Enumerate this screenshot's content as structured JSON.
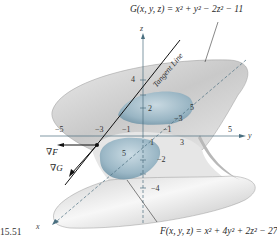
{
  "figure": {
    "number": "15.51",
    "surfaces": {
      "G": {
        "equation": "G(x, y, z) = x² + y² − 2z² − 11",
        "type": "hyperboloid of one sheet",
        "color": "#d8d8d8"
      },
      "F": {
        "equation": "F(x, y, z) = x² + 4y² + 2z² − 27",
        "type": "ellipsoid",
        "color": "#9fbccb"
      }
    },
    "axes": {
      "x": {
        "label": "x",
        "ticks": [
          "5"
        ]
      },
      "y": {
        "label": "y",
        "ticks": [
          "−5",
          "−3",
          "−1",
          "1",
          "3",
          "5"
        ]
      },
      "z": {
        "label": "z",
        "ticks": [
          "4",
          "2",
          "−2",
          "−4"
        ]
      }
    },
    "extra_ticks": [
      "−3",
      "5",
      "−1",
      "1"
    ],
    "annotations": {
      "tangent_line": "Tangent Line",
      "grad_F": "∇F",
      "grad_G": "∇G"
    }
  }
}
